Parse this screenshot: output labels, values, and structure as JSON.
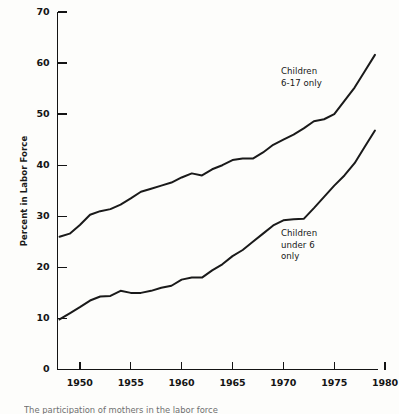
{
  "chart_data": {
    "type": "line",
    "title": "",
    "xlabel": "",
    "ylabel": "Percent in Labor Force",
    "xlim": [
      1947.8,
      1979.3
    ],
    "ylim": [
      0,
      70
    ],
    "grid": false,
    "legend_position": "inline-annotation",
    "y_ticks": [
      0,
      10,
      20,
      30,
      40,
      50,
      60,
      70
    ],
    "y_tick_labels": [
      "0",
      "10",
      "20",
      "30",
      "40",
      "50",
      "60",
      "70"
    ],
    "x_ticks": [
      1950,
      1955,
      1960,
      1965,
      1970,
      1975,
      1980
    ],
    "x_tick_labels": [
      "1950",
      "1955",
      "1960",
      "1965",
      "1970",
      "1975",
      "1980"
    ],
    "series": [
      {
        "name": "Children 6-17 only",
        "annotation": "Children\n6-17 only",
        "color": "#1a1a1a",
        "x": [
          1948,
          1949,
          1950,
          1951,
          1952,
          1953,
          1954,
          1955,
          1956,
          1957,
          1958,
          1959,
          1960,
          1961,
          1962,
          1963,
          1964,
          1965,
          1966,
          1967,
          1968,
          1969,
          1970,
          1971,
          1972,
          1973,
          1974,
          1975,
          1976,
          1977,
          1978,
          1979
        ],
        "values": [
          26.0,
          26.6,
          28.3,
          30.3,
          31.0,
          31.4,
          32.3,
          33.5,
          34.8,
          35.4,
          36.0,
          36.6,
          37.6,
          38.4,
          38.0,
          39.2,
          40.0,
          41.0,
          41.3,
          41.3,
          42.5,
          44.0,
          45.0,
          46.0,
          47.2,
          48.6,
          49.0,
          50.0,
          52.6,
          55.2,
          58.4,
          61.6
        ]
      },
      {
        "name": "Children under 6 only",
        "annotation": "Children\nunder 6\nonly",
        "color": "#1a1a1a",
        "x": [
          1948,
          1949,
          1950,
          1951,
          1952,
          1953,
          1954,
          1955,
          1956,
          1957,
          1958,
          1959,
          1960,
          1961,
          1962,
          1963,
          1964,
          1965,
          1966,
          1967,
          1968,
          1969,
          1970,
          1971,
          1972,
          1973,
          1974,
          1975,
          1976,
          1977,
          1978,
          1979
        ],
        "values": [
          9.8,
          11.0,
          12.2,
          13.5,
          14.3,
          14.4,
          15.4,
          15.0,
          15.0,
          15.4,
          16.0,
          16.4,
          17.6,
          18.0,
          18.0,
          19.4,
          20.6,
          22.2,
          23.4,
          25.0,
          26.6,
          28.2,
          29.2,
          29.4,
          29.5,
          31.6,
          33.8,
          36.0,
          38.0,
          40.4,
          43.6,
          46.8
        ]
      }
    ]
  },
  "axis": {
    "y_title": "Percent in Labor Force"
  },
  "annotations": {
    "upper": "Children\n6-17 only",
    "lower": "Children\nunder 6\nonly"
  },
  "caption": {
    "text": "The participation of mothers in the labor force"
  }
}
